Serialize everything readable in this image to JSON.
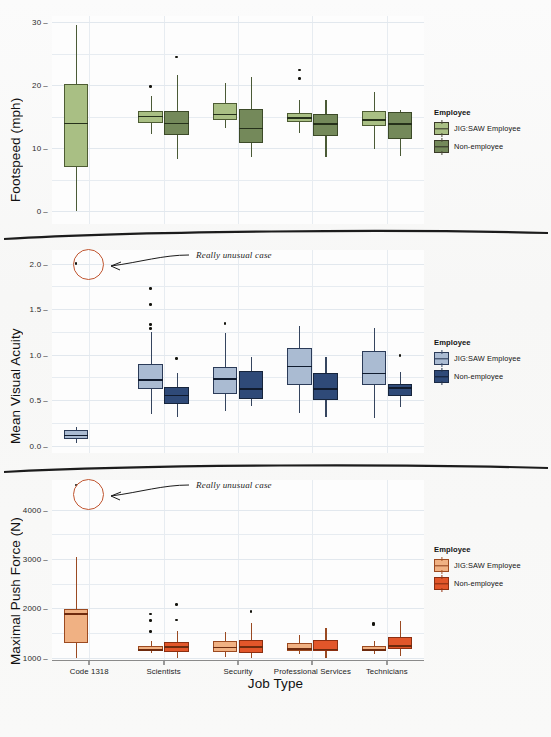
{
  "figure": {
    "xlabel": "Job Type",
    "categories": [
      "Code 1318",
      "Scientists",
      "Security",
      "Professional Services",
      "Technicians"
    ],
    "legend_title": "Employee",
    "series_names": [
      "JIG:SAW Employee",
      "Non-employee"
    ],
    "annotation_text": "Really unusual case"
  },
  "colors": {
    "green_light": "#a9bf84",
    "green_dark": "#74895a",
    "blue_light": "#aabbd2",
    "blue_dark": "#2f4a78",
    "orange_light": "#f0b183",
    "orange_dark": "#e2562a",
    "annotation": "#c0552f",
    "grid": "#e7ecf1"
  },
  "chart_data": [
    {
      "type": "box",
      "panel": "footspeed",
      "title": "",
      "ylabel": "Footspeed (mph)",
      "xlabel": "Job Type",
      "ylim": [
        -2,
        31
      ],
      "yticks": [
        0,
        10,
        20,
        30
      ],
      "ytick_labels": [
        "0",
        "10",
        "20",
        "30"
      ],
      "grid": true,
      "legend_position": "right",
      "categories": [
        "Code 1318",
        "Scientists",
        "Security",
        "Professional Services",
        "Technicians"
      ],
      "series": [
        {
          "name": "JIG:SAW Employee",
          "color": "#a9bf84",
          "boxes": [
            {
              "category": "Code 1318",
              "whisker_low": 0.1,
              "q1": 7.0,
              "median": 14.1,
              "q3": 20.2,
              "whisker_high": 29.5,
              "outliers": []
            },
            {
              "category": "Scientists",
              "whisker_low": 12.3,
              "q1": 14.0,
              "median": 15.2,
              "q3": 16.0,
              "whisker_high": 18.3,
              "outliers": [
                19.8
              ]
            },
            {
              "category": "Security",
              "whisker_low": 13.2,
              "q1": 14.5,
              "median": 15.5,
              "q3": 17.2,
              "whisker_high": 20.4,
              "outliers": []
            },
            {
              "category": "Professional Services",
              "whisker_low": 12.5,
              "q1": 14.2,
              "median": 14.9,
              "q3": 15.6,
              "whisker_high": 17.6,
              "outliers": [
                22.4,
                21.1
              ]
            },
            {
              "category": "Technicians",
              "whisker_low": 9.9,
              "q1": 13.6,
              "median": 14.6,
              "q3": 15.9,
              "whisker_high": 18.9,
              "outliers": []
            }
          ]
        },
        {
          "name": "Non-employee",
          "color": "#74895a",
          "boxes": [
            {
              "category": "Code 1318",
              "whisker_low": null,
              "q1": null,
              "median": null,
              "q3": null,
              "whisker_high": null,
              "outliers": []
            },
            {
              "category": "Scientists",
              "whisker_low": 8.3,
              "q1": 12.1,
              "median": 14.1,
              "q3": 16.0,
              "whisker_high": 21.7,
              "outliers": [
                24.5
              ]
            },
            {
              "category": "Security",
              "whisker_low": 8.6,
              "q1": 10.8,
              "median": 13.3,
              "q3": 16.2,
              "whisker_high": 21.3,
              "outliers": []
            },
            {
              "category": "Professional Services",
              "whisker_low": 8.6,
              "q1": 11.9,
              "median": 14.0,
              "q3": 15.4,
              "whisker_high": 17.6,
              "outliers": []
            },
            {
              "category": "Technicians",
              "whisker_low": 8.8,
              "q1": 11.5,
              "median": 14.0,
              "q3": 15.7,
              "whisker_high": 16.1,
              "outliers": []
            }
          ]
        }
      ]
    },
    {
      "type": "box",
      "panel": "visual_acuity",
      "title": "",
      "ylabel": "Mean Visual Acuity",
      "xlabel": "Job Type",
      "ylim": [
        -0.08,
        2.15
      ],
      "yticks": [
        0.0,
        0.5,
        1.0,
        1.5,
        2.0
      ],
      "ytick_labels": [
        "0.0",
        "0.5",
        "1.0",
        "1.5",
        "2.0"
      ],
      "grid": true,
      "legend_position": "right",
      "annotation": {
        "text": "Really unusual case",
        "point_value": 2.0,
        "category": "Code 1318"
      },
      "categories": [
        "Code 1318",
        "Scientists",
        "Security",
        "Professional Services",
        "Technicians"
      ],
      "series": [
        {
          "name": "JIG:SAW Employee",
          "color": "#aabbd2",
          "boxes": [
            {
              "category": "Code 1318",
              "whisker_low": 0.03,
              "q1": 0.07,
              "median": 0.12,
              "q3": 0.17,
              "whisker_high": 0.21,
              "outliers": [
                2.0
              ]
            },
            {
              "category": "Scientists",
              "whisker_low": 0.35,
              "q1": 0.62,
              "median": 0.73,
              "q3": 0.9,
              "whisker_high": 1.25,
              "outliers": [
                1.73,
                1.55,
                1.33,
                1.29
              ]
            },
            {
              "category": "Security",
              "whisker_low": 0.38,
              "q1": 0.57,
              "median": 0.74,
              "q3": 0.87,
              "whisker_high": 1.24,
              "outliers": [
                1.34
              ]
            },
            {
              "category": "Professional Services",
              "whisker_low": 0.36,
              "q1": 0.67,
              "median": 0.88,
              "q3": 1.07,
              "whisker_high": 1.32,
              "outliers": []
            },
            {
              "category": "Technicians",
              "whisker_low": 0.3,
              "q1": 0.67,
              "median": 0.8,
              "q3": 1.04,
              "whisker_high": 1.29,
              "outliers": []
            }
          ]
        },
        {
          "name": "Non-employee",
          "color": "#2f4a78",
          "boxes": [
            {
              "category": "Code 1318",
              "whisker_low": null,
              "q1": null,
              "median": null,
              "q3": null,
              "whisker_high": null,
              "outliers": []
            },
            {
              "category": "Scientists",
              "whisker_low": 0.32,
              "q1": 0.46,
              "median": 0.56,
              "q3": 0.65,
              "whisker_high": 0.8,
              "outliers": [
                0.96
              ]
            },
            {
              "category": "Security",
              "whisker_low": 0.44,
              "q1": 0.51,
              "median": 0.63,
              "q3": 0.82,
              "whisker_high": 0.98,
              "outliers": []
            },
            {
              "category": "Professional Services",
              "whisker_low": 0.31,
              "q1": 0.5,
              "median": 0.63,
              "q3": 0.8,
              "whisker_high": 0.98,
              "outliers": []
            },
            {
              "category": "Technicians",
              "whisker_low": 0.42,
              "q1": 0.55,
              "median": 0.64,
              "q3": 0.68,
              "whisker_high": 0.81,
              "outliers": [
                0.99
              ]
            }
          ]
        }
      ]
    },
    {
      "type": "box",
      "panel": "push_force",
      "title": "",
      "ylabel": "Maximal Push Force (N)",
      "xlabel": "Job Type",
      "ylim": [
        950,
        4600
      ],
      "yticks": [
        1000,
        2000,
        3000,
        4000
      ],
      "ytick_labels": [
        "1000",
        "2000",
        "3000",
        "4000"
      ],
      "grid": true,
      "legend_position": "right",
      "annotation": {
        "text": "Really unusual case",
        "point_value": 4500,
        "category": "Code 1318"
      },
      "categories": [
        "Code 1318",
        "Scientists",
        "Security",
        "Professional Services",
        "Technicians"
      ],
      "series": [
        {
          "name": "JIG:SAW Employee",
          "color": "#f0b183",
          "boxes": [
            {
              "category": "Code 1318",
              "whisker_low": 1000,
              "q1": 1290,
              "median": 1900,
              "q3": 1990,
              "whisker_high": 3040,
              "outliers": [
                4500
              ]
            },
            {
              "category": "Scientists",
              "whisker_low": 1085,
              "q1": 1130,
              "median": 1165,
              "q3": 1240,
              "whisker_high": 1340,
              "outliers": [
                1880,
                1745,
                1525
              ]
            },
            {
              "category": "Security",
              "whisker_low": 1015,
              "q1": 1110,
              "median": 1220,
              "q3": 1345,
              "whisker_high": 1520,
              "outliers": []
            },
            {
              "category": "Professional Services",
              "whisker_low": 1080,
              "q1": 1140,
              "median": 1185,
              "q3": 1290,
              "whisker_high": 1450,
              "outliers": []
            },
            {
              "category": "Technicians",
              "whisker_low": 1075,
              "q1": 1125,
              "median": 1165,
              "q3": 1235,
              "whisker_high": 1330,
              "outliers": [
                1695,
                1675
              ]
            }
          ]
        },
        {
          "name": "Non-employee",
          "color": "#e2562a",
          "boxes": [
            {
              "category": "Code 1318",
              "whisker_low": null,
              "q1": null,
              "median": null,
              "q3": null,
              "whisker_high": null,
              "outliers": []
            },
            {
              "category": "Scientists",
              "whisker_low": 1000,
              "q1": 1120,
              "median": 1225,
              "q3": 1320,
              "whisker_high": 1535,
              "outliers": [
                2070,
                1760
              ]
            },
            {
              "category": "Security",
              "whisker_low": 995,
              "q1": 1095,
              "median": 1225,
              "q3": 1360,
              "whisker_high": 1710,
              "outliers": [
                1930
              ]
            },
            {
              "category": "Professional Services",
              "whisker_low": 1000,
              "q1": 1135,
              "median": 1180,
              "q3": 1360,
              "whisker_high": 1590,
              "outliers": []
            },
            {
              "category": "Technicians",
              "whisker_low": 1040,
              "q1": 1165,
              "median": 1245,
              "q3": 1410,
              "whisker_high": 1740,
              "outliers": []
            }
          ]
        }
      ]
    }
  ]
}
